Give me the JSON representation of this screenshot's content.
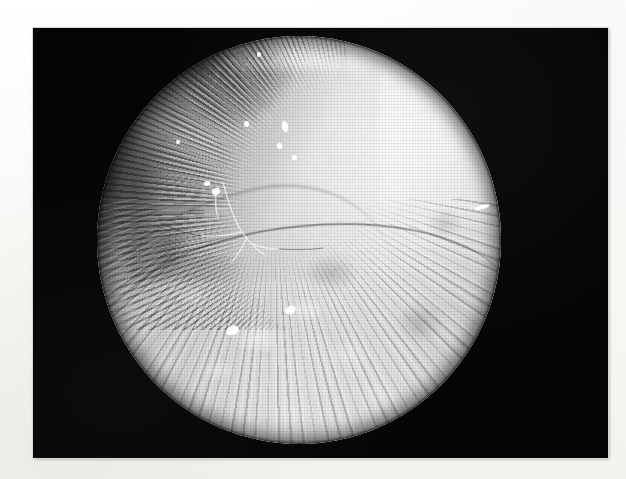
{
  "page": {
    "background_color": "#fafaf8",
    "width": 626,
    "height": 479
  },
  "figure": {
    "frame": {
      "name": "photographic-plate",
      "background_color": "#040404",
      "x": 33,
      "y": 28,
      "width": 575,
      "height": 430
    },
    "scope_view": {
      "modality": "endoscopic / arthroscopic photograph",
      "color_mode": "grayscale",
      "aperture_shape": "circle",
      "center_x": 299,
      "center_y": 240,
      "radius": 202,
      "description": "Circular endoscope field of view showing pale tissue with a bright convex upper-right surface, a dark striated rim at the upper left, a curved fold crossing the middle, and coarse granular tissue filling the lower half."
    },
    "regions": [
      {
        "name": "bright-convex-surface",
        "label": "upper-right bright tissue lobe",
        "tone": "#f3f1ec"
      },
      {
        "name": "striated-dark-rim",
        "label": "upper-left shadowed fibrous rim",
        "tone": "#3a3936"
      },
      {
        "name": "transverse-fold",
        "label": "curved crease across mid-field",
        "tone": "#565450"
      },
      {
        "name": "granular-tissue",
        "label": "lower granular / villous tissue",
        "tone": "#c6c4be"
      }
    ],
    "specular_highlights": [
      {
        "name": "highlight-1",
        "x": 246,
        "y": 124,
        "w": 5,
        "h": 6,
        "angle": 0
      },
      {
        "name": "highlight-2",
        "x": 285,
        "y": 126,
        "w": 6,
        "h": 11,
        "angle": -12
      },
      {
        "name": "highlight-3",
        "x": 279,
        "y": 146,
        "w": 5,
        "h": 6,
        "angle": 0
      },
      {
        "name": "highlight-4",
        "x": 294,
        "y": 157,
        "w": 5,
        "h": 5,
        "angle": 0
      },
      {
        "name": "highlight-5",
        "x": 207,
        "y": 183,
        "w": 6,
        "h": 5,
        "angle": 0
      },
      {
        "name": "highlight-6",
        "x": 216,
        "y": 191,
        "w": 8,
        "h": 7,
        "angle": -20
      },
      {
        "name": "highlight-7",
        "x": 259,
        "y": 54,
        "w": 4,
        "h": 5,
        "angle": 0
      },
      {
        "name": "highlight-8",
        "x": 482,
        "y": 207,
        "w": 16,
        "h": 4,
        "angle": -14
      },
      {
        "name": "highlight-9",
        "x": 178,
        "y": 142,
        "w": 4,
        "h": 4,
        "angle": 0
      },
      {
        "name": "highlight-10",
        "x": 232,
        "y": 330,
        "w": 13,
        "h": 9,
        "angle": -18
      },
      {
        "name": "highlight-11",
        "x": 290,
        "y": 310,
        "w": 11,
        "h": 8,
        "angle": -24
      }
    ],
    "filament": {
      "name": "tissue-fibre-strand",
      "label": "thin branching filament crossing the mid-left field"
    },
    "caption": {
      "text": "(a)",
      "note": "faint, heavily faded scan text beneath the plate"
    }
  }
}
